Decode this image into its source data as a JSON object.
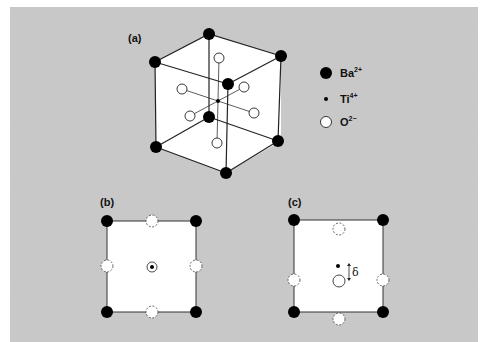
{
  "panels": {
    "a": {
      "label": "(a)"
    },
    "b": {
      "label": "(b)"
    },
    "c": {
      "label": "(c)",
      "displacement_symbol": "δ"
    }
  },
  "legend": {
    "items": [
      {
        "ion": "Ba",
        "charge": "2+",
        "marker": "large-filled-circle"
      },
      {
        "ion": "Ti",
        "charge": "4+",
        "marker": "small-dot"
      },
      {
        "ion": "O",
        "charge": "2−",
        "marker": "open-circle"
      }
    ]
  },
  "colors": {
    "background": "#c9c9c9",
    "face": "#ffffff",
    "ion_fill": "#000000",
    "line": "#222222"
  }
}
